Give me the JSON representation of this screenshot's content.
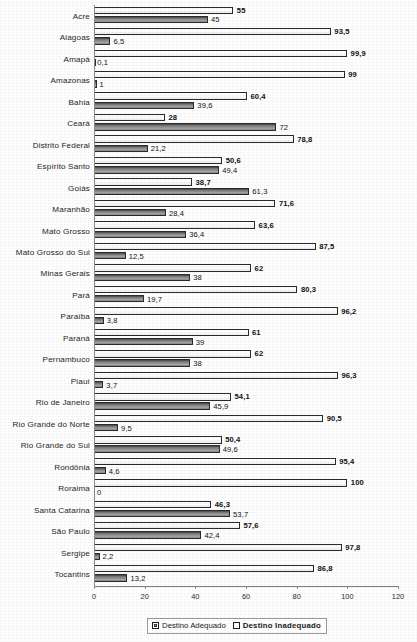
{
  "chart_data": {
    "type": "bar",
    "orientation": "horizontal",
    "grouped": true,
    "title": "",
    "xlabel": "",
    "ylabel": "",
    "xlim": [
      0,
      120
    ],
    "xticks": [
      0,
      20,
      40,
      60,
      80,
      100,
      120
    ],
    "grid": false,
    "legend_position": "bottom",
    "categories": [
      "Acre",
      "Alagoas",
      "Amapá",
      "Amazonas",
      "Bahia",
      "Ceará",
      "Distrito Federal",
      "Espírito Santo",
      "Goiás",
      "Maranhão",
      "Mato Grosso",
      "Mato Grosso do Sul",
      "Minas Gerais",
      "Pará",
      "Paraíba",
      "Paraná",
      "Pernambuco",
      "Piauí",
      "Rio de Janeiro",
      "Rio Grande do Norte",
      "Rio Grande do Sul",
      "Rondônia",
      "Roraima",
      "Santa Catarina",
      "São Paulo",
      "Sergipe",
      "Tocantins"
    ],
    "series": [
      {
        "name": "Destino Adequado",
        "values": [
          45,
          6.5,
          0.1,
          1,
          39.6,
          72,
          21.2,
          49.4,
          61.3,
          28.4,
          36.4,
          12.5,
          38,
          19.7,
          3.8,
          39,
          38,
          3.7,
          45.9,
          9.5,
          49.6,
          4.6,
          0,
          53.7,
          42.4,
          2.2,
          13.2
        ],
        "labels": [
          "45",
          "6,5",
          "0,1",
          "1",
          "39,6",
          "72",
          "21,2",
          "49,4",
          "61,3",
          "28,4",
          "36,4",
          "12,5",
          "38",
          "19,7",
          "3,8",
          "39",
          "38",
          "3,7",
          "45,9",
          "9,5",
          "49,6",
          "4,6",
          "0",
          "53,7",
          "42,4",
          "2,2",
          "13,2"
        ]
      },
      {
        "name": "Destino Inadequado",
        "values": [
          55,
          93.5,
          99.9,
          99,
          60.4,
          28,
          78.8,
          50.6,
          38.7,
          71.6,
          63.6,
          87.5,
          62,
          80.3,
          96.2,
          61,
          62,
          96.3,
          54.1,
          90.5,
          50.4,
          95.4,
          100,
          46.3,
          57.6,
          97.8,
          86.8
        ],
        "labels": [
          "55",
          "93,5",
          "99,9",
          "99",
          "60,4",
          "28",
          "78,8",
          "50,6",
          "38,7",
          "71,6",
          "63,6",
          "87,5",
          "62",
          "80,3",
          "96,2",
          "61",
          "62",
          "96,3",
          "54,1",
          "90,5",
          "50,4",
          "95,4",
          "100",
          "46,3",
          "57,6",
          "97,8",
          "86,8"
        ]
      }
    ],
    "legend": [
      "Destino Adequado",
      "Destino Inadequado"
    ],
    "colors": {
      "adequado": "#8c8c8c",
      "inadequado": "#ffffff",
      "outline": "#2b2b2b",
      "axis": "#8a8a8a"
    }
  }
}
